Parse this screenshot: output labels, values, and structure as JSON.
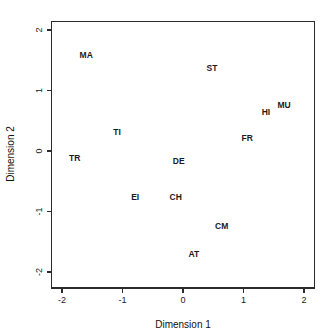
{
  "chart_data": {
    "type": "scatter",
    "title": "",
    "subtitle": "",
    "xlabel": "Dimension 1",
    "ylabel": "Dimension 2",
    "xlim": [
      -2.18,
      2.18
    ],
    "ylim": [
      -2.15,
      2.21
    ],
    "grid": false,
    "legend": null,
    "legend_position": "none",
    "marker_style": "text-label-only",
    "xticks": [
      -2,
      -1,
      0,
      1,
      2
    ],
    "xticklabels": [
      "-2",
      "-1",
      "0",
      "1",
      "2"
    ],
    "yticks": [
      -2,
      -1,
      0,
      1,
      2
    ],
    "yticklabels": [
      "-2",
      "-1",
      "0",
      "1",
      "2"
    ],
    "points": [
      {
        "label": "MA",
        "x": -1.6,
        "y": 1.57
      },
      {
        "label": "ST",
        "x": 0.48,
        "y": 1.36
      },
      {
        "label": "MU",
        "x": 1.67,
        "y": 0.74
      },
      {
        "label": "HI",
        "x": 1.37,
        "y": 0.63
      },
      {
        "label": "TI",
        "x": -1.09,
        "y": 0.3
      },
      {
        "label": "FR",
        "x": 1.06,
        "y": 0.2
      },
      {
        "label": "TR",
        "x": -1.79,
        "y": -0.13
      },
      {
        "label": "DE",
        "x": -0.07,
        "y": -0.18
      },
      {
        "label": "EI",
        "x": -0.79,
        "y": -0.78
      },
      {
        "label": "CH",
        "x": -0.12,
        "y": -0.78
      },
      {
        "label": "CM",
        "x": 0.64,
        "y": -1.26
      },
      {
        "label": "AT",
        "x": 0.18,
        "y": -1.72
      }
    ],
    "colors": {
      "background": "#ffffff",
      "frame": "#2b2b2b",
      "text": "#1a1a1a",
      "label": "#1a1a1a"
    }
  }
}
